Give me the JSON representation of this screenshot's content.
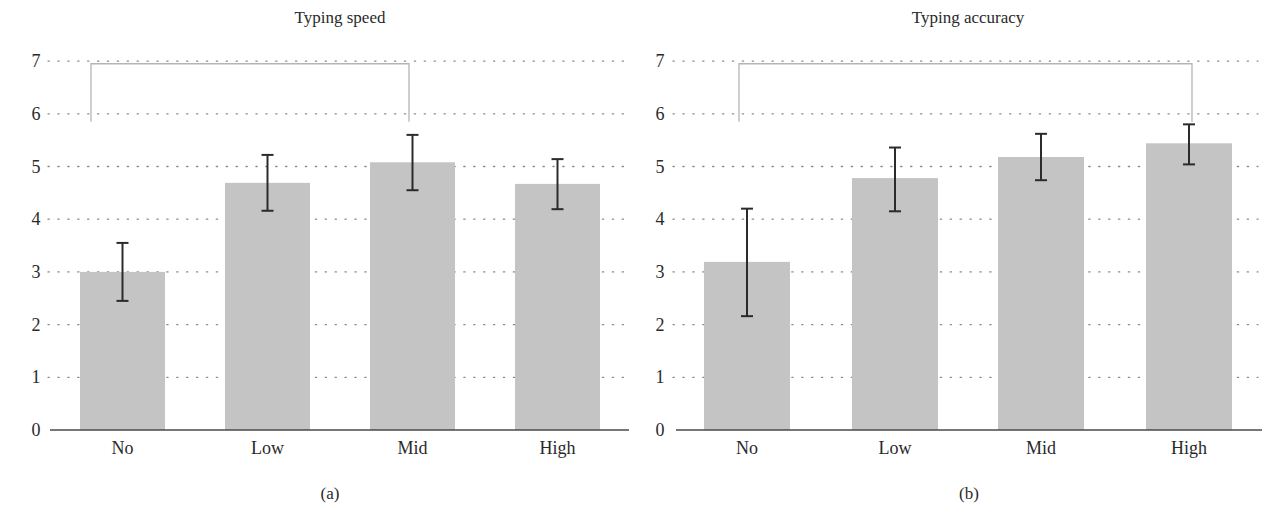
{
  "colors": {
    "bar": "#c4c4c4",
    "error_bar": "#2b2b2b",
    "grid": "#8a8a8a",
    "axis": "#4a4a4a",
    "bracket": "#b5b5b5",
    "text": "#2a2a2a"
  },
  "layout": {
    "y_zero_px": 430,
    "px_per_unit": 52.7
  },
  "panels": [
    {
      "label": "(a)",
      "label_x": 330,
      "title_x": 340,
      "axis_label_x": 36,
      "grid_x1": 48,
      "grid_x2": 628,
      "axis_x1": 50,
      "axis_x2": 629,
      "bar_width": 85,
      "bar_x": [
        80,
        225,
        370,
        515
      ],
      "bracket": {
        "x1": 91,
        "x2": 409,
        "top_value": 6.95,
        "bottom_value": 5.85
      }
    },
    {
      "label": "(b)",
      "label_x": 969,
      "title_x": 968,
      "axis_label_x": 660,
      "grid_x1": 673,
      "grid_x2": 1258,
      "axis_x1": 676,
      "axis_x2": 1262,
      "bar_width": 86,
      "bar_x": [
        704,
        852,
        998,
        1146
      ],
      "bracket": {
        "x1": 739,
        "x2": 1192,
        "top_value": 6.95,
        "bottom_value": 5.85
      }
    }
  ],
  "chart_data": [
    {
      "type": "bar",
      "title": "Typing speed",
      "subtitle": "(a)",
      "xlabel": "",
      "ylabel": "",
      "categories": [
        "No",
        "Low",
        "Mid",
        "High"
      ],
      "values": [
        3.0,
        4.69,
        5.08,
        4.67
      ],
      "error_upper": [
        3.55,
        5.22,
        5.6,
        5.14
      ],
      "error_lower": [
        2.45,
        4.16,
        4.55,
        4.19
      ],
      "yticks": [
        0,
        1,
        2,
        3,
        4,
        5,
        6,
        7
      ],
      "ylim": [
        0,
        7
      ],
      "grid": "dotted horizontal",
      "annotations": [
        {
          "type": "significance-bracket",
          "from": "No",
          "to": "Mid"
        }
      ],
      "legend": null
    },
    {
      "type": "bar",
      "title": "Typing accuracy",
      "subtitle": "(b)",
      "xlabel": "",
      "ylabel": "",
      "categories": [
        "No",
        "Low",
        "Mid",
        "High"
      ],
      "values": [
        3.19,
        4.78,
        5.18,
        5.44
      ],
      "error_upper": [
        4.2,
        5.36,
        5.62,
        5.8
      ],
      "error_lower": [
        2.16,
        4.15,
        4.74,
        5.04
      ],
      "yticks": [
        0,
        1,
        2,
        3,
        4,
        5,
        6,
        7
      ],
      "ylim": [
        0,
        7
      ],
      "grid": "dotted horizontal",
      "annotations": [
        {
          "type": "significance-bracket",
          "from": "No",
          "to": "High"
        }
      ],
      "legend": null
    }
  ]
}
